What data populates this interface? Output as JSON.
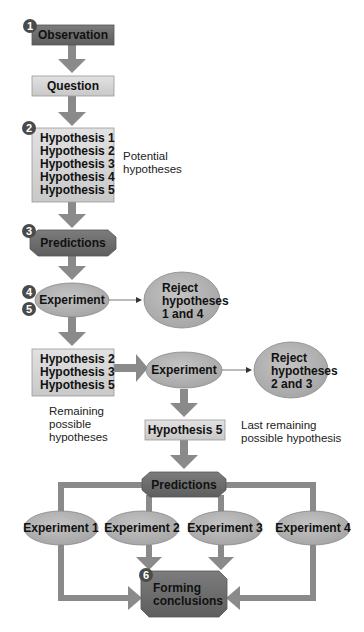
{
  "colors": {
    "dark_box": "#6e6e6e",
    "light_box": "#d6d6d6",
    "oval": "#b4b4b4",
    "arrow": "#8a8a8a",
    "step_badge": "#4a4a4a"
  },
  "steps": {
    "s1": "1",
    "s2": "2",
    "s3": "3",
    "s4": "4",
    "s5": "5",
    "s6": "6"
  },
  "nodes": {
    "observation": "Observation",
    "question": "Question",
    "hypotheses_all": [
      "Hypothesis 1",
      "Hypothesis 2",
      "Hypothesis 3",
      "Hypothesis 4",
      "Hypothesis 5"
    ],
    "predictions_1": "Predictions",
    "experiment_1": "Experiment",
    "reject_1": [
      "Reject",
      "hypotheses",
      "1 and 4"
    ],
    "hypotheses_remaining": [
      "Hypothesis 2",
      "Hypothesis 3",
      "Hypothesis 5"
    ],
    "experiment_2": "Experiment",
    "reject_2": [
      "Reject",
      "hypotheses",
      "2 and 3"
    ],
    "hypothesis_last": "Hypothesis 5",
    "predictions_2": "Predictions",
    "experiments": [
      "Experiment 1",
      "Experiment 2",
      "Experiment 3",
      "Experiment 4"
    ],
    "conclusions": [
      "Forming",
      "conclusions"
    ]
  },
  "notes": {
    "potential": [
      "Potential",
      "hypotheses"
    ],
    "remaining": [
      "Remaining",
      "possible",
      "hypotheses"
    ],
    "last": [
      "Last remaining",
      "possible hypothesis"
    ]
  }
}
